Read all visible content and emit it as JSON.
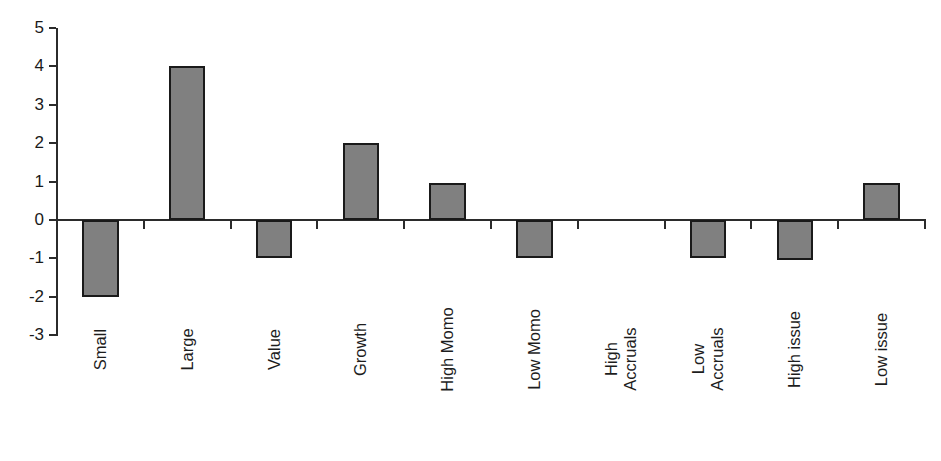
{
  "chart_data": {
    "type": "bar",
    "title": "",
    "subtitle": "",
    "xlabel": "",
    "ylabel": "",
    "categories": [
      "Small",
      "Large",
      "Value",
      "Growth",
      "High Momo",
      "Low Momo",
      "High Accruals",
      "Low Accruals",
      "High issue",
      "Low issue"
    ],
    "values": [
      -2,
      4,
      -1,
      2,
      0.95,
      -1,
      0,
      -1,
      -1.05,
      0.95
    ],
    "ylim": [
      -3,
      5
    ],
    "yticks": [
      5,
      4,
      3,
      2,
      1,
      0,
      -1,
      -2,
      -3
    ],
    "ytick_labels": [
      "5",
      "4",
      "3",
      "2",
      "1",
      "0",
      "-1",
      "-2",
      "-3"
    ],
    "grid": false,
    "legend": false,
    "legend_position": "none",
    "bar_fill_color": "#808080",
    "bar_edge_color": "#1a1a1a",
    "axis_color": "#2b2b2b",
    "background_color": "#ffffff"
  },
  "axis": {
    "y_axis_name": "y-axis",
    "x_axis_name": "category-axis"
  }
}
